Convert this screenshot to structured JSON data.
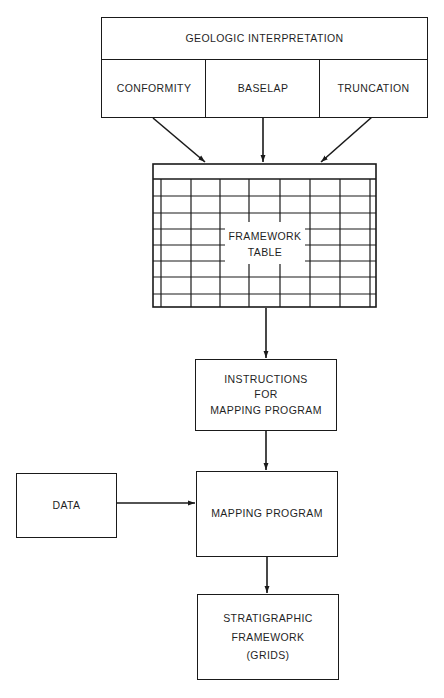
{
  "diagram": {
    "type": "flowchart",
    "colors": {
      "stroke": "#1a1a1a",
      "text": "#1f1f1f",
      "background": "#ffffff"
    },
    "geologic_interpretation": {
      "title": "GEOLOGIC INTERPRETATION",
      "categories": [
        "CONFORMITY",
        "BASELAP",
        "TRUNCATION"
      ]
    },
    "framework_table": {
      "label_line1": "FRAMEWORK",
      "label_line2": "TABLE"
    },
    "instructions": {
      "line1": "INSTRUCTIONS",
      "line2": "FOR",
      "line3": "MAPPING PROGRAM"
    },
    "data_box": {
      "label": "DATA"
    },
    "mapping_program": {
      "label": "MAPPING PROGRAM"
    },
    "output": {
      "line1": "STRATIGRAPHIC",
      "line2": "FRAMEWORK",
      "line3": "(GRIDS)"
    },
    "edges": [
      {
        "from": "CONFORMITY",
        "to": "FRAMEWORK TABLE"
      },
      {
        "from": "BASELAP",
        "to": "FRAMEWORK TABLE"
      },
      {
        "from": "TRUNCATION",
        "to": "FRAMEWORK TABLE"
      },
      {
        "from": "FRAMEWORK TABLE",
        "to": "INSTRUCTIONS FOR MAPPING PROGRAM"
      },
      {
        "from": "INSTRUCTIONS FOR MAPPING PROGRAM",
        "to": "MAPPING PROGRAM"
      },
      {
        "from": "DATA",
        "to": "MAPPING PROGRAM"
      },
      {
        "from": "MAPPING PROGRAM",
        "to": "STRATIGRAPHIC FRAMEWORK (GRIDS)"
      }
    ]
  }
}
